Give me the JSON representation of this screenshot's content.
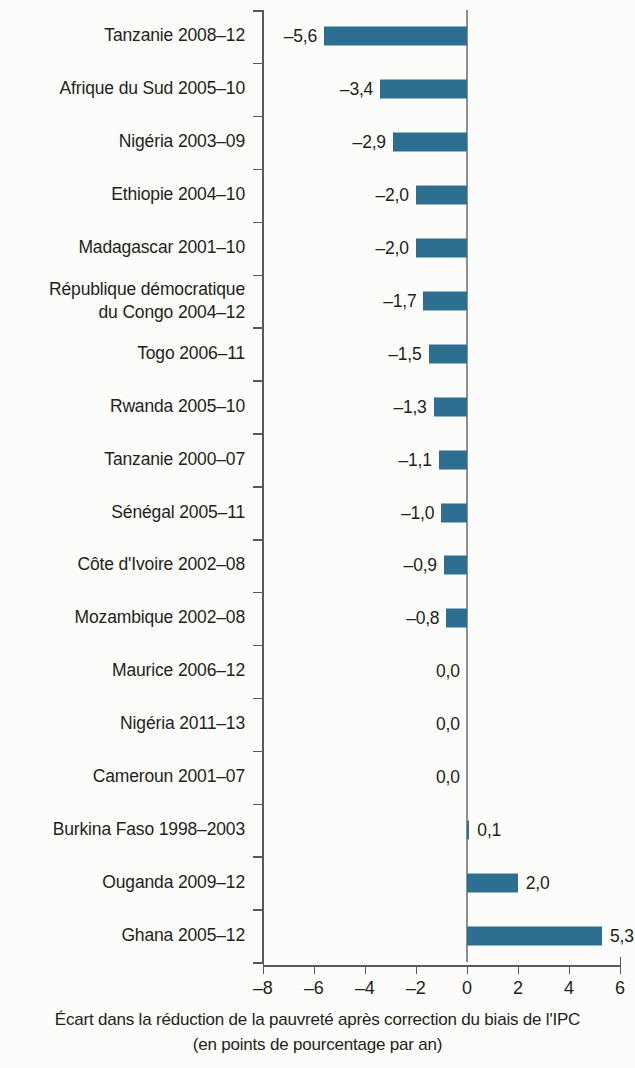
{
  "chart_data": {
    "type": "bar",
    "orientation": "horizontal",
    "title": "",
    "subtitle": "",
    "xlabel": "Écart dans la réduction de la pauvreté après correction du biais de l'IPC (en points de pourcentage par an)",
    "ylabel": "",
    "xlim": [
      -8,
      6
    ],
    "xticks": [
      -8,
      -6,
      -4,
      -2,
      0,
      2,
      4,
      6
    ],
    "xtick_labels": [
      "–8",
      "–6",
      "–4",
      "–2",
      "0",
      "2",
      "4",
      "6"
    ],
    "grid": false,
    "legend": null,
    "bar_color": "#2d6e91",
    "zero_line_color": "#8d8f92",
    "axis_color": "#58595b",
    "background": "#fcfcfa",
    "categories": [
      "Tanzanie 2008–12",
      "Afrique du Sud 2005–10",
      "Nigéria 2003–09",
      "Ethiopie 2004–10",
      "Madagascar 2001–10",
      "République démocratique\ndu Congo 2004–12",
      "Togo 2006–11",
      "Rwanda 2005–10",
      "Tanzanie 2000–07",
      "Sénégal 2005–11",
      "Côte d'Ivoire 2002–08",
      "Mozambique 2002–08",
      "Maurice 2006–12",
      "Nigéria 2011–13",
      "Cameroun 2001–07",
      "Burkina Faso 1998–2003",
      "Ouganda 2009–12",
      "Ghana 2005–12"
    ],
    "values": [
      -5.6,
      -3.4,
      -2.9,
      -2.0,
      -2.0,
      -1.7,
      -1.5,
      -1.3,
      -1.1,
      -1.0,
      -0.9,
      -0.8,
      0.0,
      0.0,
      0.0,
      0.1,
      2.0,
      5.3
    ],
    "value_labels": [
      "–5,6",
      "–3,4",
      "–2,9",
      "–2,0",
      "–2,0",
      "–1,7",
      "–1,5",
      "–1,3",
      "–1,1",
      "–1,0",
      "–0,9",
      "–0,8",
      "0,0",
      "0,0",
      "0,0",
      "0,1",
      "2,0",
      "5,3"
    ]
  },
  "caption": {
    "line1": "Écart dans la réduction de la pauvreté après correction du biais de l'IPC",
    "line2": "(en points de pourcentage par an)"
  }
}
